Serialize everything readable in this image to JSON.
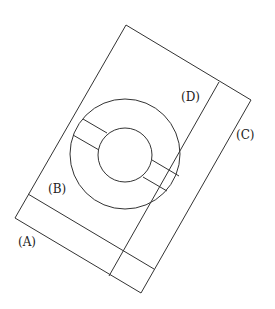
{
  "diagram": {
    "labels": {
      "A": "(A)",
      "B": "(B)",
      "C": "(C)",
      "D": "(D)"
    },
    "line_color": "#333333",
    "background": "#ffffff"
  }
}
